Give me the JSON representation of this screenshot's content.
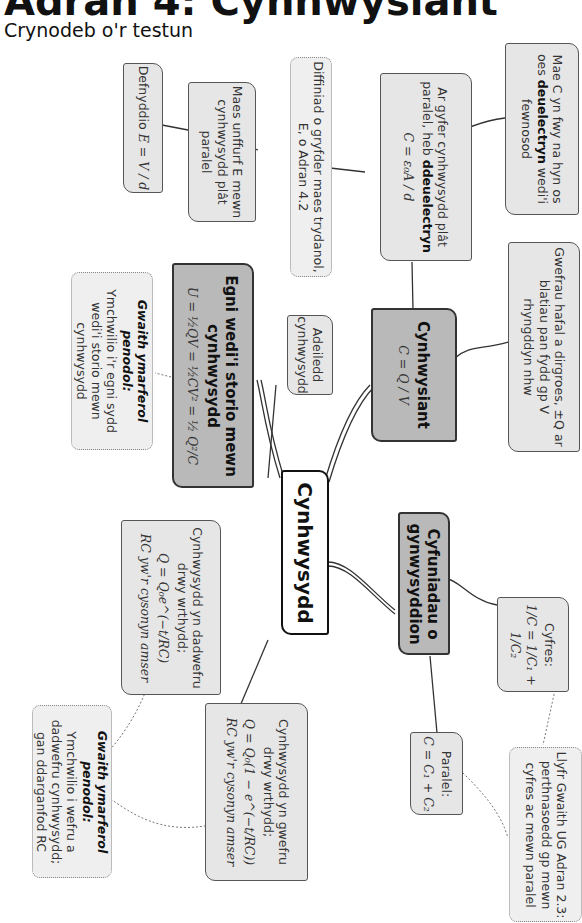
{
  "header": {
    "title": "Adran 4: Cynhwysiant",
    "subtitle": "Crynodeb o'r testun"
  },
  "diagram": {
    "orientation": "rotated 90° clockwise (text reads top-to-bottom)",
    "center": {
      "label": "Cynhwysydd"
    },
    "nodes": {
      "capacitance": {
        "heading": "Cynhwysiant",
        "equation": "C = Q / V"
      },
      "energy": {
        "heading": "Egni wedi'i storio mewn cynhwysydd",
        "equation": "U = ½QV = ½CV² = ½ Q²/C"
      },
      "combinations": {
        "heading": "Cyfuniadau o gynwysyddion"
      },
      "structure": {
        "text": "Adeiledd cynhwysydd"
      },
      "charges": {
        "text": "Gwefrau hafal a dirgroes, ±Q ar blatiau pan fydd gp V rhyngddyn nhw"
      },
      "parallel_plate": {
        "text_a": "Ar gyfer cynhwysydd plât paralel, heb ",
        "bold": "ddeuelectryn",
        "equation": "C = ε₀A / d"
      },
      "dielectric": {
        "text_a": "Mae C yn fwy na hyn os oes ",
        "bold": "deuelectryn",
        "text_b": " wedi'i fewnosod"
      },
      "field_def": {
        "text": "Diffiniad o gryfder maes trydanol, E, o Adran 4.2"
      },
      "uniform_field": {
        "text": "Maes unffurf E mewn cynhwysydd plât paralel"
      },
      "use_E": {
        "text": "Defnyddio",
        "equation": "E = V / d"
      },
      "practical_energy": {
        "heading": "Gwaith ymarferol penodol:",
        "text": "Ymchwilio i'r egni sydd wedi'i storio mewn cynhwysydd"
      },
      "discharge": {
        "text": "Cynhwysydd yn dadwefru drwy wrthydd;",
        "equation": "Q = Q₀e^(−t/RC)",
        "note": "RC yw'r cysonyn amser"
      },
      "charging": {
        "text": "Cynhwysydd yn gwefru drwy wrthydd;",
        "equation": "Q = Q₀(1 − e^(−t/RC))",
        "note": "RC yw'r cysonyn amser"
      },
      "practical_charge": {
        "heading": "Gwaith ymarferol penodol:",
        "text": "Ymchwilio i wefru a dadwefru cynhwysydd; gan ddarganfod RC"
      },
      "series": {
        "heading": "Cyfres:",
        "equation": "1/C = 1/C₁ + 1/C₂"
      },
      "parallel": {
        "heading": "Paralel:",
        "equation": "C = C₁ + C₂"
      },
      "workbook": {
        "text": "Llyfr Gwaith UG Adran 2.3: perthnasoedd gp mewn cyfres ac mewn paralel"
      }
    }
  },
  "colors": {
    "dark_node": "#b9b9b9",
    "light_node": "#e6e6e6",
    "dotted_node": "#efefef",
    "border": "#555555"
  }
}
